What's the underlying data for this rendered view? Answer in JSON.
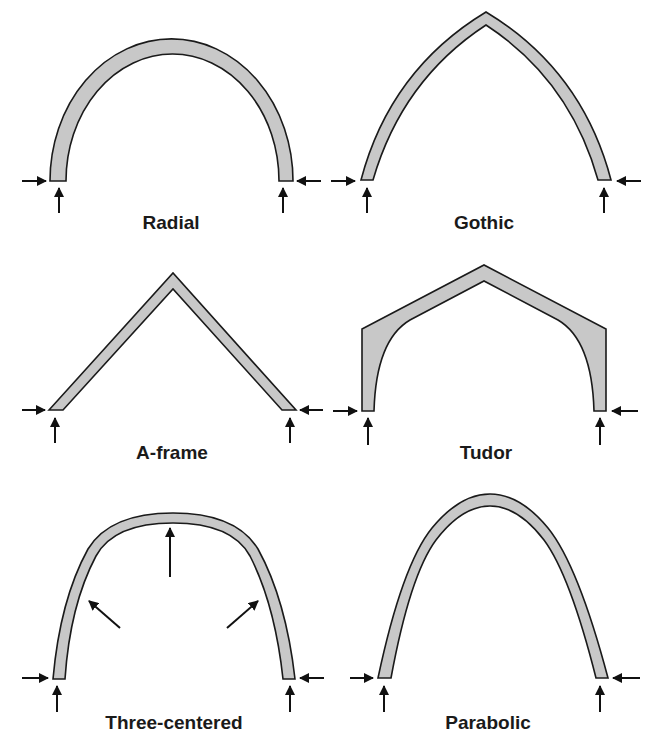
{
  "figure": {
    "fill_color": "#c8c8c8",
    "stroke_color": "#1a1a1a",
    "arches": [
      {
        "id": "radial",
        "label": "Radial"
      },
      {
        "id": "gothic",
        "label": "Gothic"
      },
      {
        "id": "a-frame",
        "label": "A-frame"
      },
      {
        "id": "tudor",
        "label": "Tudor"
      },
      {
        "id": "three-centered",
        "label": "Three-centered"
      },
      {
        "id": "parabolic",
        "label": "Parabolic"
      }
    ]
  }
}
